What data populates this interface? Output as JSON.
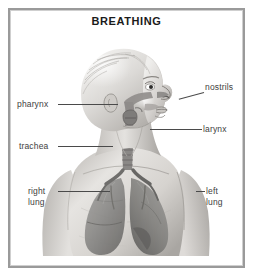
{
  "figure": {
    "title": "BREATHING",
    "style": "grayscale-pencil-anatomical-diagram",
    "colors": {
      "background": "#ffffff",
      "frame_border": "#9a9a9a",
      "title_text": "#1b1b1b",
      "label_text": "#3e3e3e",
      "leader_line": "#4a4a4a",
      "skin_light": "#e9e7e4",
      "skin_mid": "#c9c6c2",
      "skin_shadow": "#9c9a97",
      "lung_fill": "#8f8f8f",
      "lung_shadow": "#6e6e6e",
      "airway": "#7c7a78"
    }
  },
  "labels": [
    {
      "id": "pharynx",
      "text": "pharynx",
      "side": "left"
    },
    {
      "id": "trachea",
      "text": "trachea",
      "side": "left"
    },
    {
      "id": "right_lung",
      "text": "right\nlung",
      "side": "left"
    },
    {
      "id": "nostrils",
      "text": "nostrils",
      "side": "right"
    },
    {
      "id": "larynx",
      "text": "larynx",
      "side": "right"
    },
    {
      "id": "left_lung",
      "text": "left\nlung",
      "side": "right"
    }
  ]
}
